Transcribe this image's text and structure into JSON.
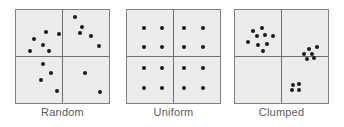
{
  "figure": {
    "width": 344,
    "height": 127,
    "background_color": "#ffffff",
    "panel_fill_color": "#ebebeb",
    "panel_border_color": "#808080",
    "divider_color": "#6e6e6e",
    "dot_color": "#1a1a1a",
    "label_color": "#5a5a5a"
  },
  "chart_data": {
    "type": "scatter",
    "title": "",
    "subtitle": "",
    "xlabel": "",
    "ylabel": "",
    "xlim": [
      0,
      100
    ],
    "ylim": [
      0,
      100
    ],
    "grid": true,
    "grid_description": "each panel is a square quadrat subdivided into four equal quadrants by one vertical and one horizontal center line",
    "legend_position": "none",
    "annotations": [
      "Random",
      "Uniform",
      "Clumped"
    ],
    "panels": [
      {
        "label": "Random",
        "dot_count": 16,
        "quadrant_counts": {
          "top_left": 5,
          "top_right": 5,
          "bottom_left": 4,
          "bottom_right": 2
        },
        "points": [
          [
            30,
            79
          ],
          [
            16,
            71
          ],
          [
            46,
            76
          ],
          [
            27,
            64
          ],
          [
            12,
            57
          ],
          [
            34,
            57
          ],
          [
            65,
            96
          ],
          [
            73,
            85
          ],
          [
            71,
            78
          ],
          [
            84,
            74
          ],
          [
            93,
            62
          ],
          [
            27,
            41
          ],
          [
            36,
            31
          ],
          [
            25,
            22
          ],
          [
            44,
            10
          ],
          [
            76,
            31
          ],
          [
            94,
            8
          ]
        ]
      },
      {
        "label": "Uniform",
        "dot_count": 16,
        "quadrant_counts": {
          "top_left": 4,
          "top_right": 4,
          "bottom_left": 4,
          "bottom_right": 4
        },
        "points": [
          [
            15,
            84
          ],
          [
            37,
            84
          ],
          [
            62,
            84
          ],
          [
            85,
            84
          ],
          [
            15,
            61
          ],
          [
            37,
            61
          ],
          [
            62,
            61
          ],
          [
            85,
            61
          ],
          [
            15,
            36
          ],
          [
            37,
            36
          ],
          [
            62,
            36
          ],
          [
            85,
            36
          ],
          [
            15,
            13
          ],
          [
            37,
            13
          ],
          [
            62,
            13
          ],
          [
            85,
            13
          ]
        ]
      },
      {
        "label": "Clumped",
        "dot_count": 19,
        "quadrant_counts": {
          "top_left": 9,
          "top_right": 6,
          "bottom_left": 0,
          "bottom_right": 4
        },
        "points": [
          [
            16,
            80
          ],
          [
            27,
            84
          ],
          [
            21,
            74
          ],
          [
            31,
            75
          ],
          [
            40,
            74
          ],
          [
            11,
            67
          ],
          [
            22,
            64
          ],
          [
            33,
            65
          ],
          [
            28,
            57
          ],
          [
            82,
            59
          ],
          [
            92,
            61
          ],
          [
            77,
            53
          ],
          [
            86,
            53
          ],
          [
            80,
            47
          ],
          [
            88,
            48
          ],
          [
            64,
            17
          ],
          [
            71,
            18
          ],
          [
            62,
            11
          ],
          [
            70,
            11
          ]
        ]
      }
    ]
  },
  "panels": [
    {
      "label": "Random"
    },
    {
      "label": "Uniform"
    },
    {
      "label": "Clumped"
    }
  ]
}
